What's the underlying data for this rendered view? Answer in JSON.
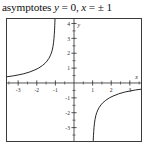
{
  "caption": {
    "prefix": "asymptotes ",
    "var_y": "y",
    "eq1": " = 0, ",
    "var_x": "x",
    "eq2": " = ± 1",
    "full_text": "asymptotes y = 0, x = ± 1"
  },
  "figure": {
    "frame_color": "#3b3b3b",
    "curve_color": "#1a1a1a",
    "axis_color": "#2a2a2a",
    "background": "#ffffff"
  },
  "chart_data": {
    "type": "line",
    "title": "asymptotes y = 0, x = ± 1",
    "xlabel": "x",
    "ylabel": "y",
    "xlim": [
      -3.6,
      3.6
    ],
    "ylim": [
      -3.9,
      4.3
    ],
    "grid": false,
    "legend": null,
    "x_ticks": [
      -3,
      -2,
      -1,
      1,
      2,
      3
    ],
    "x_tick_labels": [
      "-3",
      "-2",
      "-1",
      "1",
      "2",
      "3"
    ],
    "x_minor_ticks": [
      -3.5,
      -2.5,
      -1.5,
      -0.5,
      0.5,
      1.5,
      2.5,
      3.5
    ],
    "y_ticks": [
      -3,
      -2,
      -1,
      1,
      2,
      3,
      4
    ],
    "y_tick_labels": [
      "-3",
      "-2",
      "-1",
      "1",
      "2",
      "3",
      "4"
    ],
    "y_minor_ticks": [
      -3.5,
      -2.5,
      -1.5,
      -0.5,
      0.5,
      1.5,
      2.5,
      3.5
    ],
    "asymptotes": {
      "horizontal": [
        0
      ],
      "vertical": [
        -1,
        1
      ],
      "note": "y = 0, x = ± 1"
    },
    "series": [
      {
        "name": "left-branch",
        "comment": "upper-left branch: rises from just above y=0 at far left to +infinity as x approaches -1 from the left",
        "x": [
          -3.6,
          -3.3,
          -3.0,
          -2.7,
          -2.4,
          -2.1,
          -1.9,
          -1.7,
          -1.55,
          -1.45,
          -1.35,
          -1.28,
          -1.22,
          -1.17,
          -1.13,
          -1.1,
          -1.075,
          -1.06,
          -1.045,
          -1.035,
          -1.028,
          -1.022
        ],
        "y": [
          0.42,
          0.47,
          0.54,
          0.62,
          0.73,
          0.88,
          1.0,
          1.17,
          1.33,
          1.47,
          1.65,
          1.82,
          2.0,
          2.2,
          2.45,
          2.7,
          3.0,
          3.25,
          3.55,
          3.85,
          4.05,
          4.3
        ]
      },
      {
        "name": "right-branch",
        "comment": "lower-right branch: falls from just below y=0 at far right to -infinity as x approaches +1 from the right",
        "x": [
          3.6,
          3.3,
          3.0,
          2.7,
          2.4,
          2.1,
          1.9,
          1.7,
          1.55,
          1.45,
          1.35,
          1.28,
          1.22,
          1.17,
          1.13,
          1.1,
          1.075,
          1.06,
          1.045,
          1.035,
          1.028,
          1.022
        ],
        "y": [
          -0.42,
          -0.47,
          -0.54,
          -0.62,
          -0.73,
          -0.88,
          -1.0,
          -1.17,
          -1.33,
          -1.47,
          -1.65,
          -1.82,
          -2.0,
          -2.2,
          -2.45,
          -2.7,
          -3.0,
          -3.25,
          -3.55,
          -3.85,
          -4.05,
          -4.3
        ]
      }
    ]
  }
}
